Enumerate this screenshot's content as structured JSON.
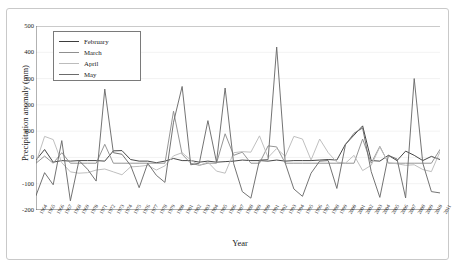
{
  "figure": {
    "y_axis_title": "Precipitation anomaly (mm)",
    "x_axis_title": "Year"
  },
  "legend": {
    "position": "top-left-inside",
    "entries": [
      {
        "label": "February",
        "color": "#3d3d3d"
      },
      {
        "label": "March",
        "color": "#8f8f8f"
      },
      {
        "label": "April",
        "color": "#bcbcbc"
      },
      {
        "label": "May",
        "color": "#6b6b6b"
      }
    ]
  },
  "chart_data": {
    "type": "line",
    "title": "",
    "subtitle": "",
    "xlabel": "Year",
    "ylabel": "Precipitation anomaly (mm)",
    "ylim": [
      -200,
      500
    ],
    "yticks": [
      -200,
      -100,
      0,
      100,
      200,
      300,
      400,
      500
    ],
    "ytick_labels": [
      "-200",
      "-100",
      "0",
      "100",
      "200",
      "300",
      "400",
      "500"
    ],
    "grid": "horizontal",
    "legend_position": "upper left",
    "x": [
      "1964",
      "1965",
      "1966",
      "1967",
      "1968",
      "1969",
      "1970",
      "1971",
      "1972",
      "1973",
      "1974",
      "1975",
      "1976",
      "1977",
      "1978",
      "1979",
      "1980",
      "1981",
      "1982",
      "1983",
      "1984",
      "1985",
      "1986",
      "1987",
      "1988",
      "1989",
      "1990",
      "1991",
      "1992",
      "1993",
      "1994",
      "1995",
      "1996",
      "1997",
      "1998",
      "1999",
      "2000",
      "2001",
      "2002",
      "2003",
      "2004",
      "2005",
      "2006",
      "2007",
      "2008",
      "2009",
      "2010",
      "2011"
    ],
    "series": [
      {
        "name": "February",
        "color": "#3d3d3d",
        "values": [
          -10,
          30,
          -18,
          -12,
          -14,
          -12,
          -12,
          -12,
          -14,
          25,
          26,
          -8,
          -14,
          -14,
          -20,
          -14,
          -4,
          -12,
          -12,
          -18,
          -14,
          -18,
          -16,
          -14,
          -10,
          -12,
          -12,
          -14,
          -10,
          -14,
          -12,
          -12,
          -12,
          -10,
          -8,
          -10,
          50,
          85,
          120,
          -12,
          -14,
          8,
          -12,
          24,
          8,
          -12,
          4,
          -8
        ]
      },
      {
        "name": "March",
        "color": "#8f8f8f",
        "values": [
          -22,
          5,
          -22,
          18,
          -22,
          -22,
          -22,
          -22,
          50,
          -22,
          -22,
          -22,
          -22,
          -22,
          -22,
          -22,
          176,
          12,
          -22,
          -30,
          -22,
          -22,
          90,
          8,
          20,
          -22,
          -22,
          44,
          40,
          -22,
          -22,
          -22,
          -22,
          -22,
          -22,
          -22,
          -22,
          -22,
          70,
          -22,
          42,
          -22,
          -22,
          -22,
          -22,
          -22,
          -22,
          30
        ]
      },
      {
        "name": "April",
        "color": "#bcbcbc",
        "values": [
          -20,
          80,
          68,
          -20,
          -55,
          -60,
          -58,
          -48,
          -44,
          -55,
          -66,
          -36,
          -34,
          -30,
          -48,
          -32,
          6,
          18,
          -10,
          -30,
          -18,
          -52,
          -60,
          18,
          22,
          20,
          82,
          0,
          34,
          4,
          80,
          70,
          -10,
          70,
          18,
          -18,
          -22,
          8,
          -50,
          -30,
          40,
          -20,
          -24,
          -30,
          -28,
          -46,
          -54,
          22
        ]
      },
      {
        "name": "May",
        "color": "#6b6b6b",
        "values": [
          -145,
          -58,
          -104,
          64,
          -165,
          -12,
          -45,
          -90,
          260,
          18,
          12,
          -30,
          -115,
          -22,
          -68,
          -95,
          134,
          270,
          -28,
          -22,
          140,
          -18,
          264,
          -24,
          -130,
          -155,
          -10,
          -8,
          420,
          -22,
          -120,
          -148,
          -60,
          -14,
          -12,
          -118,
          48,
          92,
          112,
          -54,
          -152,
          8,
          -6,
          -154,
          300,
          -22,
          -130,
          -135
        ]
      }
    ]
  }
}
